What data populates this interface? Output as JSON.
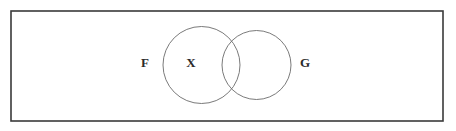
{
  "figure": {
    "type": "venn-diagram",
    "title": "",
    "background_color": "#ffffff"
  },
  "universe": {
    "name": "universal-set-rectangle",
    "label": "",
    "x": 11,
    "y": 11,
    "width": 432,
    "height": 110,
    "stroke_color": "#3a3a3a",
    "stroke_width": 1.6,
    "fill": "none"
  },
  "sets": [
    {
      "id": "set-f",
      "label": "F",
      "label_x": 145,
      "label_y": 64,
      "circle": {
        "cx": 201.5,
        "cy": 65,
        "r": 38.5
      },
      "stroke_color": "#6b6b6b",
      "stroke_width": 0.9,
      "fill": "none"
    },
    {
      "id": "set-g",
      "label": "G",
      "label_x": 305,
      "label_y": 64,
      "circle": {
        "cx": 256.5,
        "cy": 65,
        "r": 34.5
      },
      "stroke_color": "#6b6b6b",
      "stroke_width": 0.9,
      "fill": "none"
    }
  ],
  "elements": [
    {
      "id": "element-x",
      "label": "X",
      "x": 191,
      "y": 64,
      "region": "inside-F-only",
      "color": "#2b2b2b"
    }
  ]
}
